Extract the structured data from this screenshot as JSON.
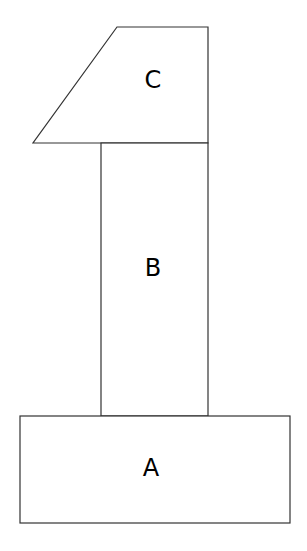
{
  "diagram": {
    "blocks": [
      {
        "id": "A",
        "label": "A",
        "shape": "rectangle"
      },
      {
        "id": "B",
        "label": "B",
        "shape": "rectangle"
      },
      {
        "id": "C",
        "label": "C",
        "shape": "trapezoid"
      }
    ],
    "stroke_color": "#333333",
    "background": "#ffffff"
  }
}
